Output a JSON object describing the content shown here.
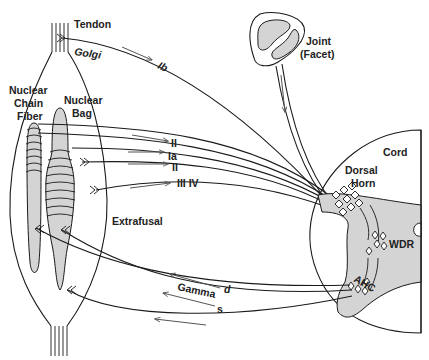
{
  "diagram": {
    "labels": {
      "tendon": "Tendon",
      "golgi": "Golgi",
      "ib": "Ib",
      "nuclear_chain_1": "Nuclear",
      "nuclear_chain_2": "Chain",
      "nuclear_chain_3": "Fiber",
      "nuclear_bag_1": "Nuclear",
      "nuclear_bag_2": "Bag",
      "fiber_ii_upper": "II",
      "fiber_ia": "Ia",
      "fiber_ii_lower": "II",
      "fiber_iii_iv": "III IV",
      "extrafusal": "Extrafusal",
      "joint_1": "Joint",
      "joint_2": "(Facet)",
      "cord": "Cord",
      "dorsal_1": "Dorsal",
      "dorsal_2": "Horn",
      "wdr": "WDR",
      "ahc": "AHC",
      "gamma": "Gamma",
      "gamma_d": "d",
      "gamma_s": "s"
    },
    "colors": {
      "line": "#1a1a1a",
      "fill_gray": "#d4d4d4",
      "arrow": "#555555",
      "background": "#ffffff"
    }
  }
}
